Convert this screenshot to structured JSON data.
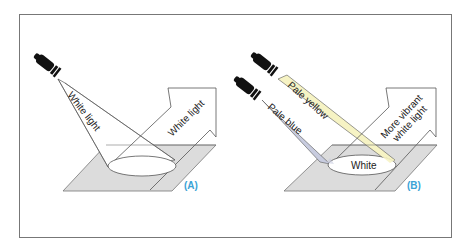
{
  "figure": {
    "panels": [
      {
        "id": "A",
        "panel_label": "(A)",
        "beam_label": "White light",
        "reflected_label": "White light"
      },
      {
        "id": "B",
        "panel_label": "(B)",
        "beam_labels": [
          "Pale yellow",
          "Pale blue"
        ],
        "spot_label": "White",
        "reflected_label_line1": "More vibrant",
        "reflected_label_line2": "white light"
      }
    ]
  },
  "colors": {
    "panel_label": "#3ba3d6",
    "surface": "#dcdcdc",
    "yellow_beam": "#f6f3c4",
    "blue_beam": "#c8ccdf",
    "lamp": "#111111",
    "outline": "#555555"
  }
}
